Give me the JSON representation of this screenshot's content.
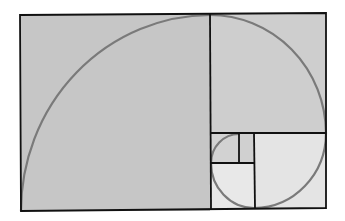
{
  "diagram": {
    "type": "golden-spiral",
    "colors": {
      "background": "#ffffff",
      "large_fill": "#c8c8c8",
      "medium_fill": "#d0d0d0",
      "small_fill": "#e6e6e6",
      "line": "#111111",
      "spiral": "#7a7a7a"
    },
    "squares": [
      {
        "name": "square-1",
        "x": 20,
        "y": 15,
        "w": 190,
        "h": 196,
        "fill": "#c6c6c6"
      },
      {
        "name": "square-2",
        "x": 210,
        "y": 14,
        "w": 116,
        "h": 119,
        "fill": "#cecece"
      },
      {
        "name": "square-3",
        "x": 254,
        "y": 133,
        "w": 72,
        "h": 75,
        "fill": "#e4e4e4"
      },
      {
        "name": "square-4",
        "x": 211,
        "y": 163,
        "w": 43,
        "h": 45,
        "fill": "#e8e8e8"
      },
      {
        "name": "square-5",
        "x": 211,
        "y": 134,
        "w": 28,
        "h": 29,
        "fill": "#d2d2d2"
      },
      {
        "name": "square-6",
        "x": 239,
        "y": 134,
        "w": 15,
        "h": 29,
        "fill": "#d0d0d0"
      }
    ]
  }
}
